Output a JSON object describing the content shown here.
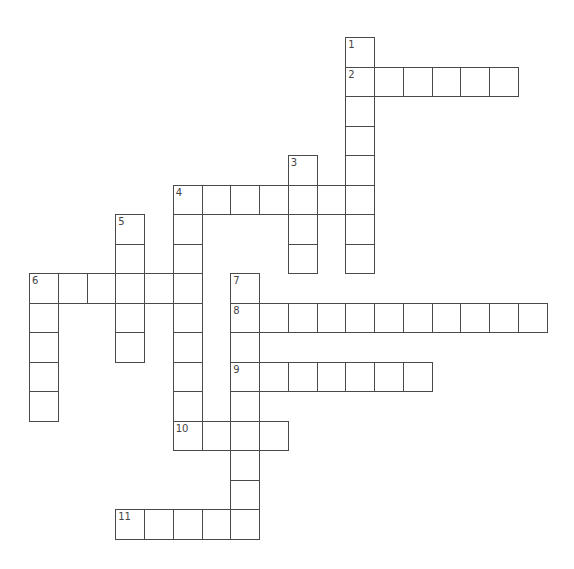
{
  "puzzle": {
    "grid": {
      "origin_x": 29,
      "origin_y": 37,
      "cell_w": 28.75,
      "cell_h": 29.5
    },
    "entries": [
      {
        "number": "1",
        "direction": "down",
        "col": 11,
        "row": 0,
        "length": 8
      },
      {
        "number": "2",
        "direction": "across",
        "col": 11,
        "row": 1,
        "length": 6
      },
      {
        "number": "3",
        "direction": "down",
        "col": 9,
        "row": 4,
        "length": 4
      },
      {
        "number": "4",
        "direction": "across",
        "col": 5,
        "row": 5,
        "length": 7
      },
      {
        "number": "4",
        "direction": "down",
        "col": 5,
        "row": 5,
        "length": 9
      },
      {
        "number": "5",
        "direction": "down",
        "col": 3,
        "row": 6,
        "length": 5
      },
      {
        "number": "6",
        "direction": "across",
        "col": 0,
        "row": 8,
        "length": 6
      },
      {
        "number": "6",
        "direction": "down",
        "col": 0,
        "row": 8,
        "length": 5
      },
      {
        "number": "7",
        "direction": "down",
        "col": 7,
        "row": 8,
        "length": 9
      },
      {
        "number": "8",
        "direction": "across",
        "col": 7,
        "row": 9,
        "length": 11
      },
      {
        "number": "9",
        "direction": "across",
        "col": 7,
        "row": 11,
        "length": 7
      },
      {
        "number": "10",
        "direction": "across",
        "col": 5,
        "row": 13,
        "length": 4
      },
      {
        "number": "11",
        "direction": "across",
        "col": 3,
        "row": 16,
        "length": 5
      }
    ],
    "colors": {
      "background": "#ffffff",
      "cell_border": "#4a4a4a",
      "number_text": "#444444"
    }
  }
}
